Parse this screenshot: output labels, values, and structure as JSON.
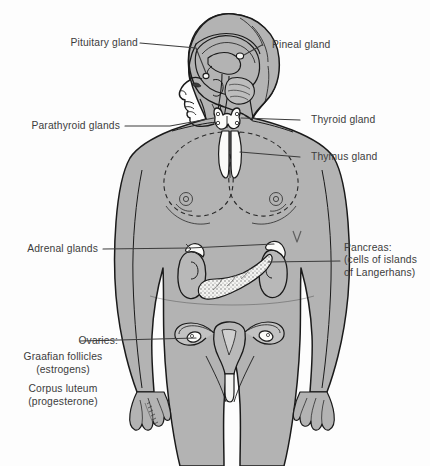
{
  "figure": {
    "background_color": "#fdfdfd",
    "body_fill_color": "#b3b3b3",
    "outline_color": "#1a1a1a",
    "organ_fill_color": "#f7f7f5",
    "label_text_color": "#3c3c3c",
    "leader_line_color": "#3c3c3c",
    "signature": "artist signature"
  },
  "labels": {
    "pituitary": {
      "text": "Pituitary gland",
      "side": "left"
    },
    "pineal": {
      "text": "Pineal gland",
      "side": "right"
    },
    "parathyroid": {
      "text": "Parathyroid glands",
      "side": "left"
    },
    "thyroid": {
      "text": "Thyroid gland",
      "side": "right"
    },
    "thymus": {
      "text": "Thymus gland",
      "side": "right"
    },
    "adrenal": {
      "text": "Adrenal glands",
      "side": "left"
    },
    "pancreas": {
      "side": "right",
      "line1": "Pancreas:",
      "line2": "(cells of islands",
      "line3": "of Langerhans)"
    },
    "ovaries": {
      "side": "left",
      "line1": "Ovaries:",
      "line2": "Graafian follicles",
      "line3": "(estrogens)",
      "line4": "Corpus luteum",
      "line5": "(progesterone)"
    }
  }
}
